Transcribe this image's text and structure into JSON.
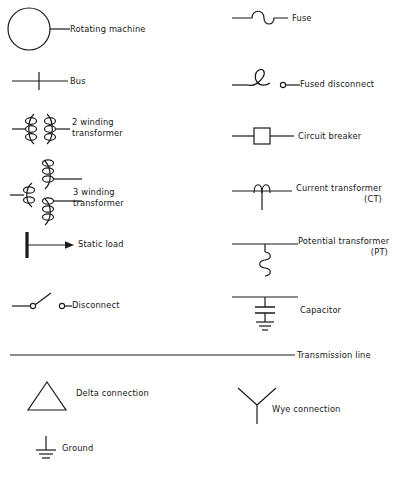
{
  "figure": {
    "kind": "electrical-one-line-diagram-symbol-legend",
    "stroke_color": "#1a1a1a",
    "text_color": "#15161a",
    "background_color": "#ffffff"
  },
  "legend": {
    "left_column": [
      {
        "id": "rotating-machine",
        "icon": "rotating-machine-icon",
        "label": "Rotating machine"
      },
      {
        "id": "bus",
        "icon": "bus-icon",
        "label": "Bus"
      },
      {
        "id": "two-winding-transformer",
        "icon": "two-winding-transformer-icon",
        "label_line1": "2 winding",
        "label_line2": "transformer"
      },
      {
        "id": "three-winding-transformer",
        "icon": "three-winding-transformer-icon",
        "label_line1": "3 winding",
        "label_line2": "transformer"
      },
      {
        "id": "static-load",
        "icon": "static-load-icon",
        "label": "Static load"
      },
      {
        "id": "disconnect",
        "icon": "disconnect-icon",
        "label": "Disconnect"
      },
      {
        "id": "delta-connection",
        "icon": "delta-connection-icon",
        "label": "Delta connection"
      },
      {
        "id": "ground",
        "icon": "ground-icon",
        "label": "Ground"
      }
    ],
    "right_column": [
      {
        "id": "fuse",
        "icon": "fuse-icon",
        "label": "Fuse"
      },
      {
        "id": "fused-disconnect",
        "icon": "fused-disconnect-icon",
        "label": "Fused disconnect"
      },
      {
        "id": "circuit-breaker",
        "icon": "circuit-breaker-icon",
        "label": "Circuit breaker"
      },
      {
        "id": "current-transformer",
        "icon": "current-transformer-icon",
        "label_line1": "Current transformer",
        "label_line2": "(CT)"
      },
      {
        "id": "potential-transformer",
        "icon": "potential-transformer-icon",
        "label_line1": "Potential transformer",
        "label_line2": "(PT)"
      },
      {
        "id": "capacitor",
        "icon": "capacitor-icon",
        "label": "Capacitor"
      },
      {
        "id": "wye-connection",
        "icon": "wye-connection-icon",
        "label": "Wye connection"
      }
    ],
    "full_width": [
      {
        "id": "transmission-line",
        "icon": "transmission-line-icon",
        "label": "Transmission line"
      }
    ]
  }
}
